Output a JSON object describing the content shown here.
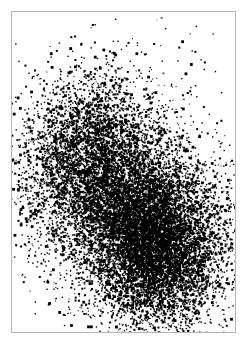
{
  "figure": {
    "width": 247,
    "height": 346,
    "background_color": "#ffffff",
    "point_color": "#000000",
    "frame": {
      "visible": true,
      "color": "#b4b4b4",
      "line_width": 1,
      "x": 11,
      "y": 11,
      "width": 225,
      "height": 322
    }
  },
  "chart_data": {
    "type": "scatter",
    "title": "",
    "subtitle": "",
    "xlabel": "",
    "ylabel": "",
    "xlim": [
      0,
      225
    ],
    "ylim": [
      0,
      322
    ],
    "grid": false,
    "legend": null,
    "axis_ticks": {
      "x": [],
      "y": []
    },
    "marker": {
      "shape": "square",
      "size_px": 1.4,
      "color": "#000000",
      "opacity": 1.0
    },
    "rendering": "dense monochrome halftone / dithered print of overlapping point clouds",
    "series": [
      {
        "name": "cluster-upper-left",
        "color": "#000000",
        "n_points": 4200,
        "distribution": "gaussian",
        "center": [
          78,
          148
        ],
        "sigma": [
          33,
          42
        ],
        "density": "sparse-speckled",
        "correlation": -0.1
      },
      {
        "name": "cluster-lower-right",
        "color": "#000000",
        "n_points": 9000,
        "distribution": "gaussian",
        "center": [
          140,
          228
        ],
        "sigma": [
          34,
          41
        ],
        "density": "dense-saturated",
        "correlation": 0.12
      },
      {
        "name": "halo-spread",
        "color": "#000000",
        "n_points": 1500,
        "distribution": "gaussian",
        "center": [
          118,
          195
        ],
        "sigma": [
          52,
          62
        ],
        "density": "diffuse",
        "correlation": 0.05
      },
      {
        "name": "outlier-specks",
        "color": "#000000",
        "n_points": 90,
        "distribution": "uniform-scatter",
        "center": [
          123,
          173
        ],
        "sigma": [
          95,
          140
        ],
        "density": "very-sparse",
        "correlation": 0.0
      }
    ],
    "annotations": []
  }
}
